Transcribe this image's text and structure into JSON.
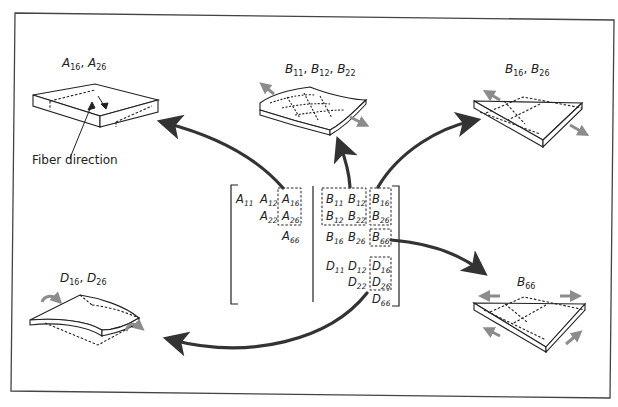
{
  "figure": {
    "type": "composite laminate stiffness matrix coupling diagram",
    "colors": {
      "line": "#222222",
      "arrow": "#333333",
      "load_arrow": "#8c8c8c",
      "background": "#ffffff"
    }
  },
  "labels": {
    "a_shear": {
      "base1": "A",
      "sub1": "16",
      "sep": ", ",
      "base2": "A",
      "sub2": "26"
    },
    "b_extension": {
      "base1": "B",
      "sub1": "11",
      "base2": "B",
      "sub2": "12",
      "base3": "B",
      "sub3": "22",
      "sep": ", "
    },
    "b_shear_ext": {
      "base1": "B",
      "sub1": "16",
      "sep": ", ",
      "base2": "B",
      "sub2": "26"
    },
    "b66": {
      "base": "B",
      "sub": "66"
    },
    "d_twist": {
      "base1": "D",
      "sub1": "16",
      "sep": ", ",
      "base2": "D",
      "sub2": "26"
    },
    "fiber_direction": "Fiber direction"
  },
  "matrix": {
    "A": [
      {
        "base": "A",
        "sub": "11"
      },
      {
        "base": "A",
        "sub": "12"
      },
      {
        "base": "A",
        "sub": "16"
      },
      {
        "base": "A",
        "sub": "22"
      },
      {
        "base": "A",
        "sub": "26"
      },
      {
        "base": "A",
        "sub": "66"
      }
    ],
    "B": [
      {
        "base": "B",
        "sub": "11"
      },
      {
        "base": "B",
        "sub": "12"
      },
      {
        "base": "B",
        "sub": "16"
      },
      {
        "base": "B",
        "sub": "12"
      },
      {
        "base": "B",
        "sub": "22"
      },
      {
        "base": "B",
        "sub": "26"
      },
      {
        "base": "B",
        "sub": "16"
      },
      {
        "base": "B",
        "sub": "26"
      },
      {
        "base": "B",
        "sub": "66"
      }
    ],
    "D": [
      {
        "base": "D",
        "sub": "11"
      },
      {
        "base": "D",
        "sub": "12"
      },
      {
        "base": "D",
        "sub": "16"
      },
      {
        "base": "D",
        "sub": "22"
      },
      {
        "base": "D",
        "sub": "26"
      },
      {
        "base": "D",
        "sub": "66"
      }
    ]
  }
}
